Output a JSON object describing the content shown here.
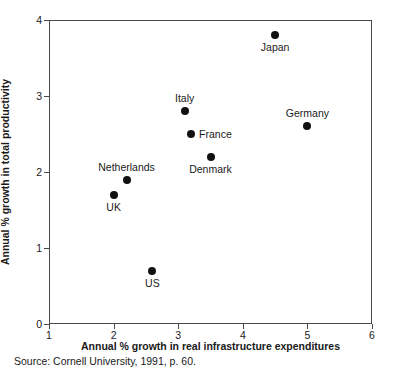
{
  "chart_data": {
    "type": "scatter",
    "title": "",
    "xlabel": "Annual % growth in real infrastructure expenditures",
    "ylabel": "Annual % growth in total productivity",
    "xlim": [
      1,
      6
    ],
    "ylim": [
      0,
      4
    ],
    "xticks": [
      "1",
      "2",
      "3",
      "4",
      "5",
      "6"
    ],
    "yticks": [
      "0",
      "1",
      "2",
      "3",
      "4"
    ],
    "grid": false,
    "legend": "none",
    "marker_color": "#111111",
    "points": [
      {
        "label": "Japan",
        "x": 4.5,
        "y": 3.8,
        "label_pos": "below"
      },
      {
        "label": "Italy",
        "x": 3.1,
        "y": 2.8,
        "label_pos": "above"
      },
      {
        "label": "Germany",
        "x": 5.0,
        "y": 2.6,
        "label_pos": "above"
      },
      {
        "label": "France",
        "x": 3.2,
        "y": 2.5,
        "label_pos": "right"
      },
      {
        "label": "Denmark",
        "x": 3.5,
        "y": 2.2,
        "label_pos": "below"
      },
      {
        "label": "Netherlands",
        "x": 2.2,
        "y": 1.9,
        "label_pos": "above"
      },
      {
        "label": "UK",
        "x": 2.0,
        "y": 1.7,
        "label_pos": "below"
      },
      {
        "label": "US",
        "x": 2.6,
        "y": 0.7,
        "label_pos": "below"
      }
    ]
  },
  "source_note": "Source: Cornell University, 1991, p. 60."
}
